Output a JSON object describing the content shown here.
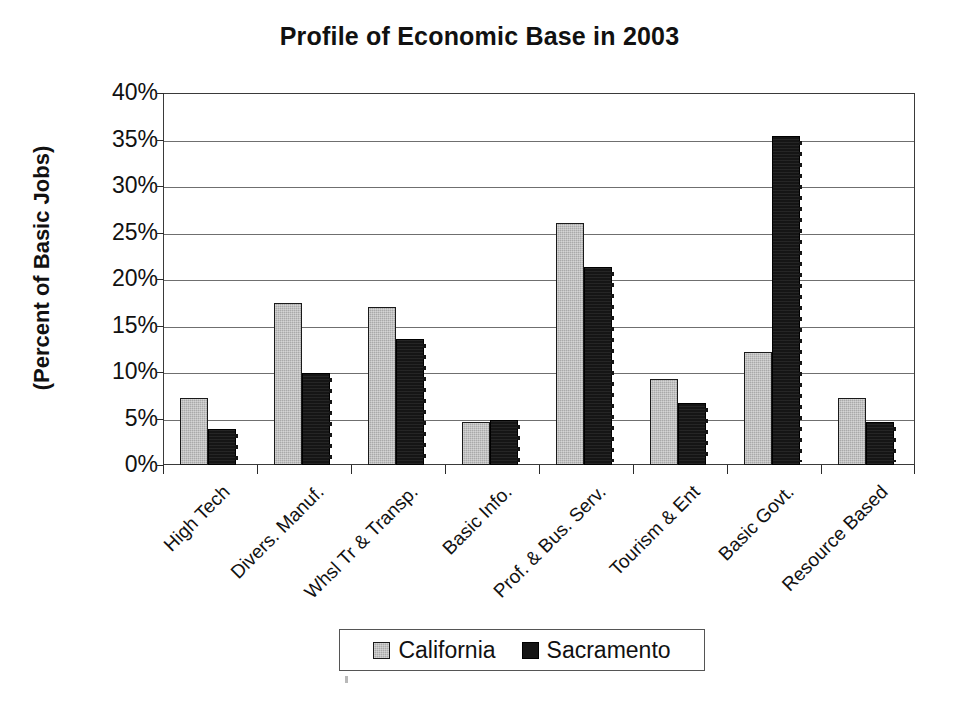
{
  "chart_data": {
    "type": "bar",
    "title": "Profile of Economic Base in 2003",
    "xlabel": "",
    "ylabel": "(Percent of Basic Jobs)",
    "ylim": [
      0,
      40
    ],
    "ytick_values": [
      40,
      35,
      30,
      25,
      20,
      15,
      10,
      5,
      0
    ],
    "ytick_labels": [
      "40%",
      "35%",
      "30%",
      "25%",
      "20%",
      "15%",
      "10%",
      "5%",
      "0%"
    ],
    "grid": true,
    "legend_position": "bottom",
    "categories": [
      "High Tech",
      "Divers. Manuf.",
      "Whsl Tr & Transp.",
      "Basic Info.",
      "Prof. & Bus. Serv.",
      "Tourism & Ent",
      "Basic Govt.",
      "Resource Based"
    ],
    "series": [
      {
        "name": "California",
        "color": "#a9a9a9",
        "values": [
          7.2,
          17.4,
          17.0,
          4.6,
          26.0,
          9.3,
          12.1,
          7.2
        ]
      },
      {
        "name": "Sacramento",
        "color": "#151515",
        "values": [
          3.9,
          9.9,
          13.6,
          4.8,
          21.3,
          6.7,
          35.4,
          4.6
        ]
      }
    ]
  },
  "legend": {
    "entries": [
      {
        "label": "California",
        "swatch": "gray-swatch-icon"
      },
      {
        "label": "Sacramento",
        "swatch": "black-swatch-icon"
      }
    ]
  }
}
